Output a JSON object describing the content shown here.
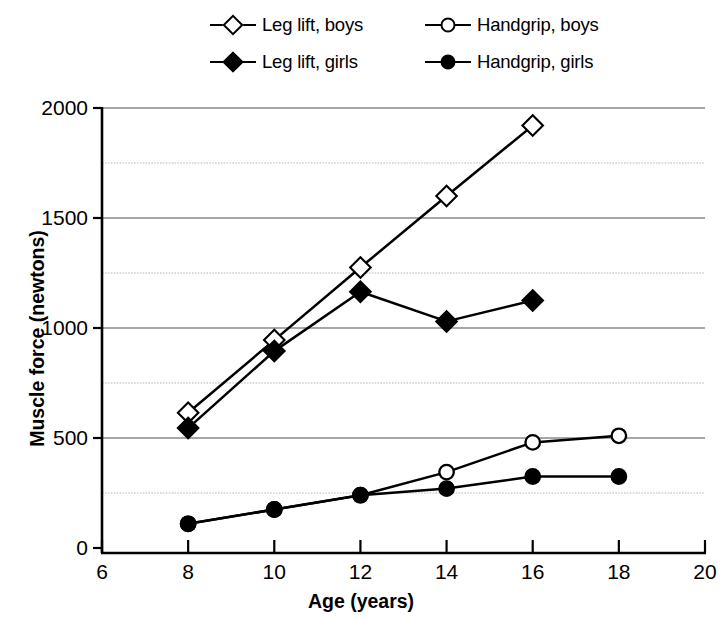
{
  "chart_data": {
    "type": "line",
    "title": "",
    "xlabel": "Age (years)",
    "ylabel": "Muscle force (newtons)",
    "xlim": [
      6,
      20
    ],
    "ylim": [
      0,
      2000
    ],
    "xticks": [
      6,
      8,
      10,
      12,
      14,
      16,
      18,
      20
    ],
    "xtick_labels": [
      "6",
      "8",
      "10",
      "12",
      "14",
      "16",
      "18",
      "20"
    ],
    "yticks": [
      0,
      500,
      1000,
      1500,
      2000
    ],
    "ytick_labels": [
      "0",
      "500",
      "1000",
      "1500",
      "2000"
    ],
    "minor_gridlines": [
      250,
      750,
      1250,
      1750
    ],
    "grid": true,
    "legend_position": "top",
    "series": [
      {
        "name": "Leg lift, boys",
        "marker": "diamond-open",
        "x": [
          8,
          10,
          12,
          14,
          16
        ],
        "values": [
          615,
          945,
          1275,
          1600,
          1920
        ]
      },
      {
        "name": "Handgrip, boys",
        "marker": "circle-open",
        "x": [
          8,
          10,
          12,
          14,
          16,
          18
        ],
        "values": [
          110,
          175,
          240,
          345,
          480,
          510
        ]
      },
      {
        "name": "Leg lift, girls",
        "marker": "diamond-filled",
        "x": [
          8,
          10,
          12,
          14,
          16
        ],
        "values": [
          545,
          895,
          1165,
          1030,
          1125
        ]
      },
      {
        "name": "Handgrip, girls",
        "marker": "circle-filled",
        "x": [
          8,
          10,
          12,
          14,
          16,
          18
        ],
        "values": [
          110,
          175,
          240,
          270,
          325,
          325
        ]
      }
    ]
  },
  "legend": {
    "entries": [
      {
        "label": "Leg lift, boys",
        "marker": "diamond-open"
      },
      {
        "label": "Handgrip, boys",
        "marker": "circle-open"
      },
      {
        "label": "Leg lift, girls",
        "marker": "diamond-filled"
      },
      {
        "label": "Handgrip, girls",
        "marker": "circle-filled"
      }
    ]
  },
  "colors": {
    "ink": "#000000",
    "background": "#ffffff",
    "grid_major": "#8a8a8a",
    "grid_minor": "#b8b8b8"
  }
}
